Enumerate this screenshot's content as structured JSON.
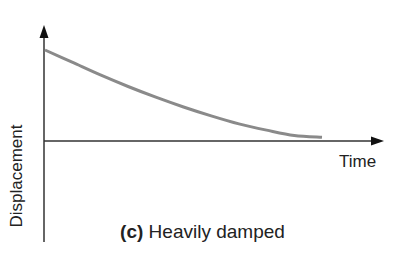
{
  "chart_data": {
    "type": "line",
    "title": "(c) Heavily damped",
    "xlabel": "Time",
    "ylabel": "Displacement",
    "grid": false,
    "legend": null,
    "series": [
      {
        "name": "Heavily damped displacement",
        "description": "Exponential-like decay from initial displacement to zero without oscillation",
        "x": [
          0,
          0.1,
          0.2,
          0.3,
          0.4,
          0.5,
          0.6,
          0.7,
          0.8,
          0.9,
          1.0
        ],
        "values": [
          1.0,
          0.86,
          0.72,
          0.59,
          0.47,
          0.36,
          0.26,
          0.17,
          0.1,
          0.04,
          0.02
        ]
      }
    ],
    "colors": {
      "curve": "#8a8a8a",
      "axes": "#222222"
    }
  },
  "labels": {
    "y_axis": "Displacement",
    "x_axis": "Time",
    "caption_prefix": "(c)",
    "caption_text": " Heavily damped"
  }
}
